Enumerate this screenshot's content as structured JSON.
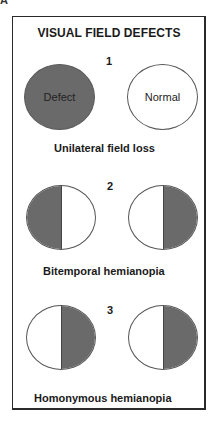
{
  "figure": {
    "corner_label": "A",
    "title": "VISUAL FIELD DEFECTS",
    "sections": [
      {
        "number": "1",
        "caption": "Unilateral field loss",
        "left_eye": {
          "fill": "full",
          "label": "Defect"
        },
        "right_eye": {
          "fill": "none",
          "label": "Normal"
        }
      },
      {
        "number": "2",
        "caption": "Bitemporal hemianopia",
        "left_eye": {
          "fill": "left-half"
        },
        "right_eye": {
          "fill": "right-half"
        }
      },
      {
        "number": "3",
        "caption": "Homonymous hemianopia",
        "left_eye": {
          "fill": "right-half"
        },
        "right_eye": {
          "fill": "right-half"
        }
      }
    ],
    "colors": {
      "defect_fill": "#6a6a6a",
      "border": "#2a2a2a",
      "background": "#ffffff"
    }
  }
}
